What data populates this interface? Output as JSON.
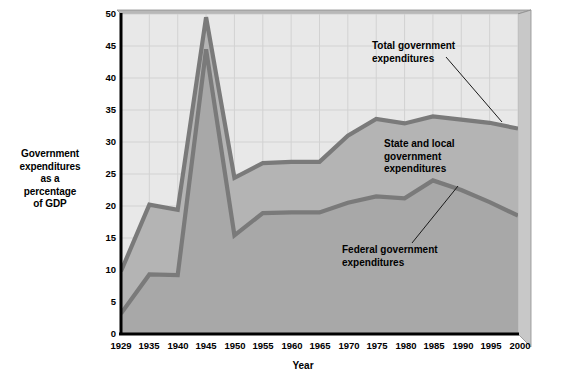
{
  "chart_data": {
    "type": "area",
    "title": "",
    "xlabel": "Year",
    "ylabel": "Government expenditures as a percentage of GDP",
    "ylabel_lines": [
      "Government",
      "expenditures",
      "as a",
      "percentage",
      "of GDP"
    ],
    "grid": true,
    "legend_position": "inline-annotations",
    "xlim": [
      1929,
      2000
    ],
    "ylim": [
      0,
      50
    ],
    "ytick_labels": [
      "0",
      "5",
      "10",
      "15",
      "20",
      "25",
      "30",
      "35",
      "40",
      "45",
      "50"
    ],
    "ytick_values": [
      0,
      5,
      10,
      15,
      20,
      25,
      30,
      35,
      40,
      45,
      50
    ],
    "categories": [
      1929,
      1935,
      1940,
      1945,
      1950,
      1955,
      1960,
      1965,
      1970,
      1975,
      1980,
      1985,
      1990,
      1995,
      2000
    ],
    "xtick_labels": [
      "1929",
      "1935",
      "1940",
      "1945",
      "1950",
      "1955",
      "1960",
      "1965",
      "1970",
      "1975",
      "1980",
      "1985",
      "1990",
      "1995",
      "2000"
    ],
    "series": [
      {
        "name": "Total government expenditures",
        "values": [
          9.8,
          20.2,
          19.4,
          49.5,
          24.4,
          26.7,
          26.9,
          26.9,
          31.0,
          33.6,
          32.9,
          34.0,
          33.5,
          33.0,
          32.1
        ]
      },
      {
        "name": "Federal government expenditures",
        "values": [
          3.2,
          9.3,
          9.2,
          44.5,
          15.4,
          18.9,
          19.0,
          19.0,
          20.5,
          21.5,
          21.2,
          24.0,
          22.5,
          20.6,
          18.5
        ]
      }
    ],
    "annotations": [
      {
        "id": "total",
        "lines": [
          "Total government",
          "expenditures"
        ],
        "text": "Total government expenditures"
      },
      {
        "id": "state-local",
        "lines": [
          "State and local",
          "government",
          "expenditures"
        ],
        "text": "State and local government expenditures"
      },
      {
        "id": "federal",
        "lines": [
          "Federal government",
          "expenditures"
        ],
        "text": "Federal government expenditures"
      }
    ],
    "colors": {
      "plot_background": "#e8e8e8",
      "total_band_fill": "#b4b4b4",
      "federal_band_fill": "#a8a8a8",
      "line": "#7a7a7a",
      "grid": "#d2d2d2",
      "axis": "#000000",
      "bevel_top": "#b8b8b8",
      "bevel_right": "#c8c8c8"
    }
  }
}
